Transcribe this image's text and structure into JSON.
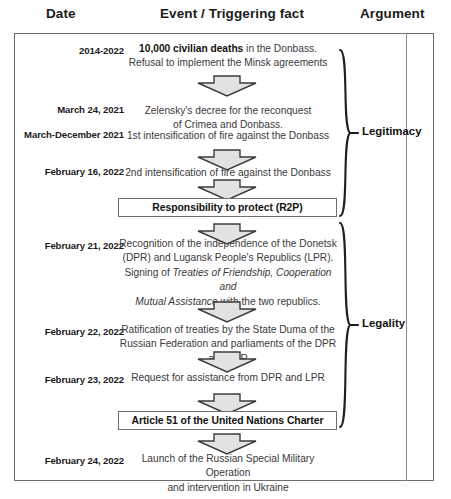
{
  "headers": {
    "date": "Date",
    "event": "Event / Triggering fact",
    "argument": "Argument"
  },
  "rows": [
    {
      "date": "2014-2022",
      "lines": [
        [
          {
            "t": "10,000 civilian deaths",
            "s": "b"
          },
          {
            "t": " in the Donbass.",
            "s": "n"
          }
        ],
        [
          {
            "t": "Refusal to implement the Minsk agreements",
            "s": "n"
          }
        ]
      ]
    },
    {
      "date": "March 24, 2021",
      "lines": [
        [
          {
            "t": "Zelensky's decree for the reconquest",
            "s": "n"
          }
        ],
        [
          {
            "t": "of Crimea and Donbass.",
            "s": "n"
          }
        ]
      ]
    },
    {
      "date": "March-December 2021",
      "lines": [
        [
          {
            "t": "1st intensification of fire against the Donbass",
            "s": "n"
          }
        ]
      ]
    },
    {
      "date": "February 16, 2022",
      "lines": [
        [
          {
            "t": "2nd intensification of fire against the Donbass",
            "s": "n"
          }
        ]
      ]
    },
    {
      "date": "February 21, 2022",
      "lines": [
        [
          {
            "t": "Recognition of the independence of the Donetsk",
            "s": "n"
          }
        ],
        [
          {
            "t": "(DPR) and Lugansk People's Republics (LPR).",
            "s": "n"
          }
        ],
        [
          {
            "t": "Signing of ",
            "s": "n"
          },
          {
            "t": "Treaties of Friendship, Cooperation and",
            "s": "i"
          }
        ],
        [
          {
            "t": "Mutual Assistance",
            "s": "i"
          },
          {
            "t": " with the two republics.",
            "s": "n"
          }
        ]
      ]
    },
    {
      "date": "February 22, 2022",
      "lines": [
        [
          {
            "t": "Ratification of treaties by the State Duma of the",
            "s": "n"
          }
        ],
        [
          {
            "t": "Russian Federation and parliaments of the DPR and LPR",
            "s": "n"
          }
        ]
      ]
    },
    {
      "date": "February 23, 2022",
      "lines": [
        [
          {
            "t": "Request for assistance from DPR and LPR",
            "s": "n"
          }
        ]
      ]
    },
    {
      "date": "February 24, 2022",
      "lines": [
        [
          {
            "t": "Launch of the Russian Special Military Operation",
            "s": "n"
          }
        ],
        [
          {
            "t": "and intervention in Ukraine",
            "s": "n"
          }
        ]
      ]
    }
  ],
  "boxes": {
    "r2p": "Responsibility to protect (R2P)",
    "article51": "Article 51 of the United Nations Charter"
  },
  "braces": {
    "legitimacy": "Legitimacy",
    "legality": "Legality"
  },
  "colors": {
    "frame_border": "#6e6e6e",
    "arrow_fill": "#e2e2e2",
    "arrow_stroke": "#3c3c3c",
    "text": "#3a3a3a",
    "heading": "#1b1b1b"
  }
}
